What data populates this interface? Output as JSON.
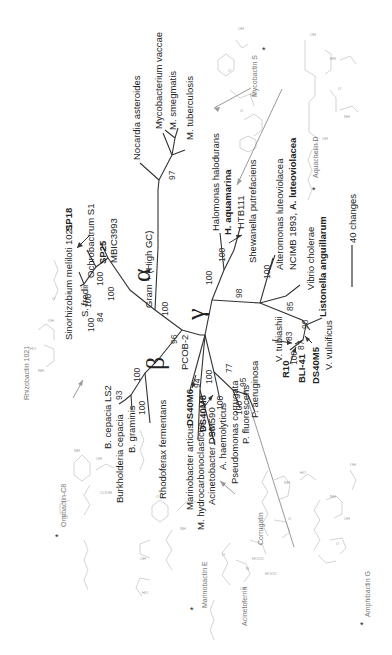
{
  "figure": {
    "type": "unrooted phylogenetic tree",
    "orientation": "rotated -90deg",
    "clades": {
      "alpha": "α",
      "beta": "β",
      "gamma": "γ",
      "gram_positive": "Gram + (High GC)"
    },
    "scale_bar": {
      "label": "40 changes"
    },
    "taxa": {
      "nocardia": "Nocardia asteroides",
      "myco_vaccae": "Mycobacterium vaccae",
      "m_smegmatis": "M. smegmatis",
      "m_tuberculosis": "M. tuberculosis",
      "halomonas": "Halomonas halodurans",
      "h_aquamarina": "H. aquamarina",
      "htb111": "HTB111",
      "shewanella": "Shewanella putrefaciens",
      "alteromonas": "Alteromonas luteoviolacea",
      "ncimb": "NCIMB 1893,",
      "a_luteoviolacea": "A. luteoviolacea",
      "vibrio": "Vibrio cholerae",
      "listonella": "Listonella anguillarum",
      "v_vulnificus": "V. vulnificus",
      "ds40m5": "DS40M5",
      "bli41": "BLI-41",
      "r10": "R10",
      "v_tubiashii": "V. tubiashii",
      "p_aeruginosa": "P. aeruginosa",
      "p_fluorescens": "P. fluorescens",
      "pseudomonas_corrugata": "Pseudomonas corrugata",
      "a_haemolyticus": "A. haemolyticus",
      "acinetobacter": "Acinetobacter DSM590",
      "m_hydrocarbonoclasticus": "M. hydrocarbonoclasticus",
      "marinobacter_articus": "Marinobacter articus",
      "ds40m8": "DS40M8",
      "ds40m6": "DS40M6",
      "pcob2": "PCOB-2",
      "rhodoferax": "Rhodoferax fermentans",
      "b_graminis": "B. graminis",
      "burkholderia_cepacia": "Burkholderia cepacia",
      "b_cepacia_ls2": "B. cepacia LS2",
      "s_fredii": "S. fredii",
      "sinorhizobium": "Sinorhizobium meliloti 1021",
      "sp18": "SP18",
      "ochrobactrum": "Ochrobactrum S1",
      "sp25": "SP25",
      "mbic3993": "MBIC3993"
    },
    "bootstrap": {
      "myco": "97",
      "gram_pos": "100",
      "alpha_main": "100",
      "alpha_inner": "100",
      "alpha_84": "84",
      "sfredii": "100",
      "sinorhizo": "100",
      "ochro": "100",
      "beta_96": "96",
      "beta_100a": "100",
      "beta_100b": "100",
      "beta_93": "93",
      "halo_100a": "100",
      "halo_100b": "100",
      "shew_98": "98",
      "alter_100": "100",
      "vib_85": "85",
      "vib_98": "98",
      "vib_83": "83",
      "vib_87": "87",
      "vib_100": "100",
      "pcob_94": "94",
      "mari_100": "100",
      "acin_100": "100",
      "acin_90": "90",
      "pseudo_77": "77",
      "pseudo_95": "95",
      "pseudo_100": "100"
    },
    "siderophores": {
      "mycobactin": "Mycobactin S",
      "aquachelin": "Aquachelin D",
      "amphibactin": "Amphibactin G",
      "corrugatin": "Corrugatin",
      "acinetoferrin": "Acinetoferrin",
      "marinobactin": "Marinobactin E",
      "ornibactin": "Ornibactin-C8",
      "rhizobactin": "Rhizobactin 1021"
    },
    "marker": "*"
  }
}
